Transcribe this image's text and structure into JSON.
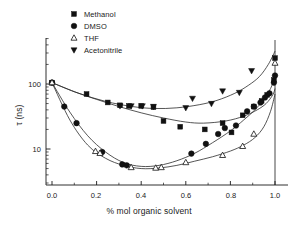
{
  "figure": {
    "background": "#ffffff",
    "foreground": "#1a1a1a",
    "curve_color": "#2b2b2b"
  },
  "axes": {
    "x_title": "% mol organic solvent",
    "y_title": "τ (ns)",
    "x_ticks": [
      "0.0",
      "0.2",
      "0.4",
      "0.6",
      "0.8",
      "1.0"
    ],
    "y_ticks": [
      "100",
      "10"
    ]
  },
  "legend": {
    "items": [
      {
        "label": "Methanol",
        "marker": "filled-square",
        "color": "#111111"
      },
      {
        "label": "DMSO",
        "marker": "filled-circle",
        "color": "#111111"
      },
      {
        "label": "THF",
        "marker": "open-triangle-up",
        "color": "#111111"
      },
      {
        "label": "Acetonitrile",
        "marker": "filled-triangle-down",
        "color": "#111111"
      }
    ]
  },
  "chart_data": {
    "type": "scatter",
    "title": "",
    "xlabel": "% mol organic solvent",
    "ylabel": "τ (ns)",
    "xlim": [
      -0.07,
      1.07
    ],
    "ylim": [
      3.0,
      400.0
    ],
    "yscale": "log",
    "xscale": "linear",
    "grid": false,
    "legend_position": "top-left",
    "x_tick_values": [
      0.0,
      0.2,
      0.4,
      0.6,
      0.8,
      1.0
    ],
    "y_tick_values": [
      100,
      10
    ],
    "series": [
      {
        "name": "Methanol",
        "marker": "filled-square",
        "points": [
          {
            "x": 0.0,
            "y": 105
          },
          {
            "x": 0.155,
            "y": 70
          },
          {
            "x": 0.25,
            "y": 52
          },
          {
            "x": 0.305,
            "y": 47
          },
          {
            "x": 0.345,
            "y": 46
          },
          {
            "x": 0.4,
            "y": 46
          },
          {
            "x": 0.455,
            "y": 44
          },
          {
            "x": 0.5,
            "y": 27
          },
          {
            "x": 0.575,
            "y": 22
          },
          {
            "x": 0.685,
            "y": 20
          },
          {
            "x": 0.765,
            "y": 25
          },
          {
            "x": 0.805,
            "y": 18
          },
          {
            "x": 0.855,
            "y": 33
          },
          {
            "x": 0.905,
            "y": 45
          },
          {
            "x": 0.94,
            "y": 55
          },
          {
            "x": 0.965,
            "y": 68
          },
          {
            "x": 0.995,
            "y": 115
          },
          {
            "x": 1.0,
            "y": 250
          }
        ],
        "fit_curve": [
          {
            "x": 0.0,
            "y": 105
          },
          {
            "x": 0.1,
            "y": 76
          },
          {
            "x": 0.2,
            "y": 58
          },
          {
            "x": 0.3,
            "y": 45
          },
          {
            "x": 0.4,
            "y": 36
          },
          {
            "x": 0.5,
            "y": 30
          },
          {
            "x": 0.6,
            "y": 26
          },
          {
            "x": 0.68,
            "y": 25
          },
          {
            "x": 0.78,
            "y": 27
          },
          {
            "x": 0.86,
            "y": 32
          },
          {
            "x": 0.92,
            "y": 40
          },
          {
            "x": 0.96,
            "y": 50
          },
          {
            "x": 0.99,
            "y": 68
          },
          {
            "x": 1.0,
            "y": 85
          }
        ]
      },
      {
        "name": "DMSO",
        "marker": "filled-circle",
        "points": [
          {
            "x": 0.0,
            "y": 105
          },
          {
            "x": 0.055,
            "y": 45
          },
          {
            "x": 0.11,
            "y": 25
          },
          {
            "x": 0.225,
            "y": 9.0
          },
          {
            "x": 0.315,
            "y": 5.8
          },
          {
            "x": 0.335,
            "y": 5.6
          },
          {
            "x": 0.625,
            "y": 8.5
          },
          {
            "x": 0.69,
            "y": 12
          },
          {
            "x": 0.745,
            "y": 17
          },
          {
            "x": 0.775,
            "y": 21
          },
          {
            "x": 0.825,
            "y": 23
          },
          {
            "x": 0.875,
            "y": 38
          },
          {
            "x": 0.905,
            "y": 45
          },
          {
            "x": 0.935,
            "y": 52
          },
          {
            "x": 0.955,
            "y": 62
          },
          {
            "x": 0.975,
            "y": 72
          },
          {
            "x": 0.995,
            "y": 105
          },
          {
            "x": 1.0,
            "y": 135
          }
        ],
        "fit_curve": [
          {
            "x": 0.0,
            "y": 105
          },
          {
            "x": 0.08,
            "y": 37
          },
          {
            "x": 0.16,
            "y": 16
          },
          {
            "x": 0.24,
            "y": 9.0
          },
          {
            "x": 0.32,
            "y": 6.2
          },
          {
            "x": 0.4,
            "y": 5.4
          },
          {
            "x": 0.48,
            "y": 5.6
          },
          {
            "x": 0.56,
            "y": 6.6
          },
          {
            "x": 0.64,
            "y": 8.6
          },
          {
            "x": 0.72,
            "y": 12.5
          },
          {
            "x": 0.8,
            "y": 19
          },
          {
            "x": 0.86,
            "y": 28
          },
          {
            "x": 0.91,
            "y": 40
          },
          {
            "x": 0.95,
            "y": 58
          },
          {
            "x": 0.98,
            "y": 85
          },
          {
            "x": 1.0,
            "y": 130
          }
        ]
      },
      {
        "name": "THF",
        "marker": "open-triangle-up",
        "points": [
          {
            "x": 0.0,
            "y": 105
          },
          {
            "x": 0.195,
            "y": 9.2
          },
          {
            "x": 0.215,
            "y": 8.6
          },
          {
            "x": 0.355,
            "y": 5.2
          },
          {
            "x": 0.465,
            "y": 5.1
          },
          {
            "x": 0.49,
            "y": 5.2
          },
          {
            "x": 0.6,
            "y": 6.2
          },
          {
            "x": 0.765,
            "y": 8.0
          },
          {
            "x": 0.855,
            "y": 11
          },
          {
            "x": 0.905,
            "y": 17
          },
          {
            "x": 1.0,
            "y": 210
          }
        ],
        "fit_curve": [
          {
            "x": 0.0,
            "y": 105
          },
          {
            "x": 0.08,
            "y": 28
          },
          {
            "x": 0.16,
            "y": 11.5
          },
          {
            "x": 0.24,
            "y": 7.2
          },
          {
            "x": 0.32,
            "y": 5.6
          },
          {
            "x": 0.4,
            "y": 5.0
          },
          {
            "x": 0.48,
            "y": 5.1
          },
          {
            "x": 0.56,
            "y": 5.6
          },
          {
            "x": 0.64,
            "y": 6.5
          },
          {
            "x": 0.72,
            "y": 7.6
          },
          {
            "x": 0.8,
            "y": 9.3
          },
          {
            "x": 0.86,
            "y": 11.5
          },
          {
            "x": 0.91,
            "y": 15
          },
          {
            "x": 0.95,
            "y": 22
          },
          {
            "x": 0.98,
            "y": 38
          },
          {
            "x": 1.0,
            "y": 70
          }
        ]
      },
      {
        "name": "Acetonitrile",
        "marker": "filled-triangle-down",
        "points": [
          {
            "x": 0.305,
            "y": 46
          },
          {
            "x": 0.355,
            "y": 46
          },
          {
            "x": 0.405,
            "y": 46
          },
          {
            "x": 0.455,
            "y": 45
          },
          {
            "x": 0.6,
            "y": 43
          },
          {
            "x": 0.63,
            "y": 60
          },
          {
            "x": 0.715,
            "y": 50
          },
          {
            "x": 0.765,
            "y": 78
          },
          {
            "x": 0.84,
            "y": 74
          },
          {
            "x": 0.895,
            "y": 160
          }
        ],
        "fit_curve": [
          {
            "x": 0.0,
            "y": 105
          },
          {
            "x": 0.12,
            "y": 72
          },
          {
            "x": 0.24,
            "y": 54
          },
          {
            "x": 0.36,
            "y": 45
          },
          {
            "x": 0.46,
            "y": 42
          },
          {
            "x": 0.56,
            "y": 43
          },
          {
            "x": 0.66,
            "y": 48
          },
          {
            "x": 0.74,
            "y": 56
          },
          {
            "x": 0.82,
            "y": 72
          },
          {
            "x": 0.88,
            "y": 95
          },
          {
            "x": 0.93,
            "y": 130
          },
          {
            "x": 0.97,
            "y": 200
          },
          {
            "x": 1.0,
            "y": 320
          }
        ]
      }
    ]
  }
}
